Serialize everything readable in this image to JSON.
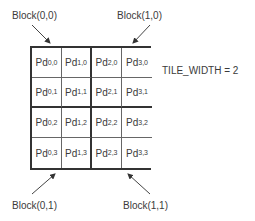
{
  "diagram": {
    "block_labels": {
      "top_left": "Block(0,0)",
      "top_right": "Block(1,0)",
      "bottom_left": "Block(0,1)",
      "bottom_right": "Block(1,1)"
    },
    "tile_width_label": "TILE_WIDTH = 2",
    "cell_prefix": "Pd",
    "cells": [
      [
        {
          "main": "Pd",
          "sub": "0,0"
        },
        {
          "main": "Pd",
          "sub": "1,0"
        },
        {
          "main": "Pd",
          "sub": "2,0"
        },
        {
          "main": "Pd",
          "sub": "3,0"
        }
      ],
      [
        {
          "main": "Pd",
          "sub": "0,1"
        },
        {
          "main": "Pd",
          "sub": "1,1"
        },
        {
          "main": "Pd",
          "sub": "2,1"
        },
        {
          "main": "Pd",
          "sub": "3,1"
        }
      ],
      [
        {
          "main": "Pd",
          "sub": "0,2"
        },
        {
          "main": "Pd",
          "sub": "1,2"
        },
        {
          "main": "Pd",
          "sub": "2,2"
        },
        {
          "main": "Pd",
          "sub": "3,2"
        }
      ],
      [
        {
          "main": "Pd",
          "sub": "0,3"
        },
        {
          "main": "Pd",
          "sub": "1,3"
        },
        {
          "main": "Pd",
          "sub": "2,3"
        },
        {
          "main": "Pd",
          "sub": "3,3"
        }
      ]
    ],
    "colors": {
      "thick_border": "#333333",
      "thin_border": "#666666",
      "text": "#3a3a3a"
    }
  }
}
